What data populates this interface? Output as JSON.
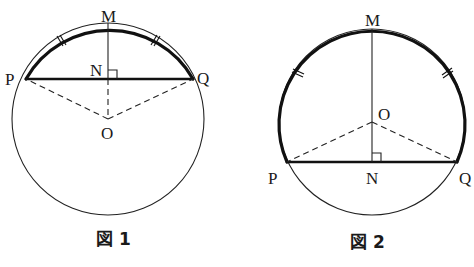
{
  "figures": [
    {
      "caption": "図 1",
      "labels": {
        "M": "M",
        "N": "N",
        "P": "P",
        "Q": "Q",
        "O": "O"
      },
      "description": "Minor arc PQ bold; chord PQ bold; MN perpendicular to PQ at N; O is center below chord; OP, ON, OQ dashed; equal-arc tick marks on arcs PM and MQ"
    },
    {
      "caption": "図 2",
      "labels": {
        "M": "M",
        "N": "N",
        "P": "P",
        "Q": "Q",
        "O": "O"
      },
      "description": "Major arc PQ bold; chord PQ bold; MN perpendicular to PQ at N; O is center above chord; OP, OQ dashed; MO solid; equal-arc tick marks on arcs PM and MQ"
    }
  ],
  "colors": {
    "ink": "#111111",
    "background": "#ffffff"
  }
}
